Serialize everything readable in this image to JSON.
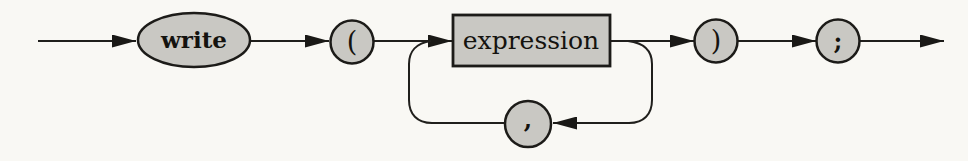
{
  "diagram": {
    "type": "railroad-syntax-diagram",
    "colors": {
      "background": "#f9f8f4",
      "node_fill": "#c9c8c3",
      "stroke": "#1c1b18",
      "arrow": "#1a1916"
    },
    "nodes": {
      "write": {
        "label": "write",
        "shape": "oval",
        "kind": "terminal-keyword"
      },
      "open_paren": {
        "label": "(",
        "shape": "circle",
        "kind": "terminal-symbol"
      },
      "expression": {
        "label": "expression",
        "shape": "rectangle",
        "kind": "nonterminal"
      },
      "close_paren": {
        "label": ")",
        "shape": "circle",
        "kind": "terminal-symbol"
      },
      "semicolon": {
        "label": ";",
        "shape": "circle",
        "kind": "terminal-symbol"
      },
      "comma": {
        "label": ",",
        "shape": "circle",
        "kind": "terminal-symbol-loop"
      }
    },
    "flow": "start → write → ( → expression → ) → ; → end, with repeat loop back through , under expression"
  }
}
